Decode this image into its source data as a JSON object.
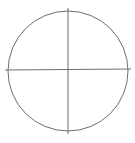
{
  "diagram": {
    "stroke_color": "#6e6e6e",
    "circle": {
      "cx": 68,
      "cy": 71,
      "r": 60
    },
    "horizontal_line": {
      "x1": 5,
      "y1": 70,
      "x2": 131,
      "y2": 69
    },
    "vertical_line": {
      "x1": 68,
      "y1": 8,
      "x2": 68,
      "y2": 134
    }
  }
}
